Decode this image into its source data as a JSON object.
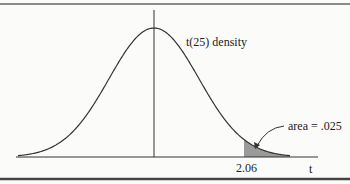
{
  "chart_data": {
    "type": "area",
    "title": "",
    "distribution": "t",
    "degrees_of_freedom": 25,
    "curve_label": "t(25) density",
    "xlabel": "t",
    "ylabel": "",
    "tick_labels": [
      "2.06"
    ],
    "critical_value": 2.06,
    "shaded_region": {
      "from": 2.06,
      "to": "infinity",
      "area": 0.025
    },
    "annotation": "area = .025",
    "grid": false,
    "legend": "none"
  },
  "labels": {
    "curve": "t(25) density",
    "area": "area = .025",
    "tick": "2.06",
    "axis": "t"
  },
  "colors": {
    "curve": "#333333",
    "shade": "#9a9a9a",
    "border": "#555555"
  }
}
